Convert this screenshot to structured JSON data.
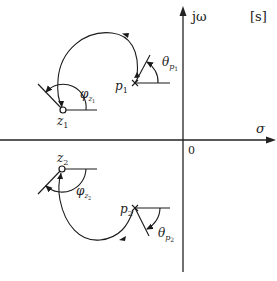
{
  "diagram": {
    "plane_label": "[s]",
    "axes": {
      "imag_label": "jω",
      "real_label": "σ",
      "origin_label": "0"
    },
    "poles": [
      {
        "id": "p1",
        "label": "p",
        "subscript": "1",
        "angle_label": "θ",
        "angle_sub": "p",
        "angle_subsub": "1"
      },
      {
        "id": "p2",
        "label": "p",
        "subscript": "2",
        "angle_label": "θ",
        "angle_sub": "p",
        "angle_subsub": "2"
      }
    ],
    "zeros": [
      {
        "id": "z1",
        "label": "z",
        "subscript": "1",
        "angle_label": "φ",
        "angle_sub": "z",
        "angle_subsub": "1"
      },
      {
        "id": "z2",
        "label": "z",
        "subscript": "2",
        "angle_label": "φ",
        "angle_sub": "z",
        "angle_subsub": "2"
      }
    ],
    "colors": {
      "stroke": "#1a1a1a",
      "background": "#ffffff"
    }
  }
}
